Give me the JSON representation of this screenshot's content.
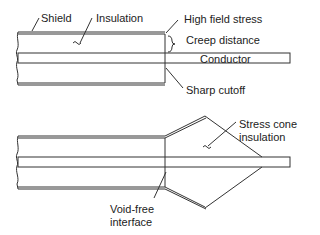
{
  "top_diagram": {
    "labels": {
      "shield": "Shield",
      "insulation": "Insulation",
      "high_field_stress": "High field stress",
      "creep_distance": "Creep distance",
      "conductor": "Conductor",
      "sharp_cutoff": "Sharp cutoff"
    }
  },
  "bottom_diagram": {
    "labels": {
      "stress_cone_line1": "Stress cone",
      "stress_cone_line2": "insulation",
      "void_free_line1": "Void-free",
      "void_free_line2": "interface"
    }
  },
  "colors": {
    "line": "#333333",
    "background": "#ffffff"
  }
}
